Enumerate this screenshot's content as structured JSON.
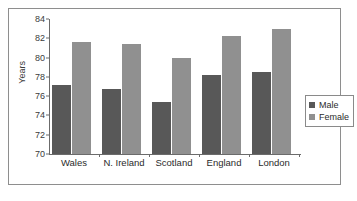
{
  "chart_data": {
    "type": "bar",
    "title": "",
    "xlabel": "",
    "ylabel": "Years",
    "ylim": [
      70,
      84
    ],
    "yticks": [
      70,
      72,
      74,
      76,
      78,
      80,
      82,
      84
    ],
    "grid": false,
    "legend_position": "right",
    "categories": [
      "Wales",
      "N. Ireland",
      "Scotland",
      "England",
      "London"
    ],
    "series": [
      {
        "name": "Male",
        "color": "#585858",
        "values": [
          77.2,
          76.7,
          75.4,
          78.2,
          78.5
        ]
      },
      {
        "name": "Female",
        "color": "#909090",
        "values": [
          81.6,
          81.4,
          80.0,
          82.2,
          83.0
        ]
      }
    ]
  },
  "legend": {
    "items": [
      {
        "label": "Male"
      },
      {
        "label": "Female"
      }
    ]
  },
  "colors": {
    "male": "#585858",
    "female": "#909090",
    "axis": "#6b6b6b",
    "frame": "#8e8e8e",
    "background": "#ffffff"
  }
}
